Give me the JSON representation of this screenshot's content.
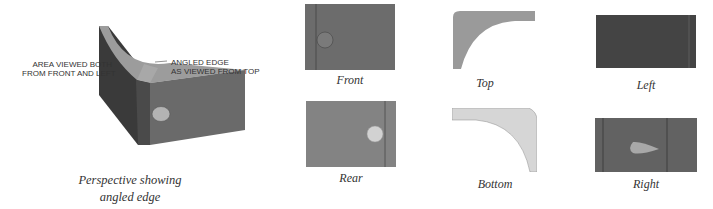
{
  "perspective": {
    "callout_left": [
      "AREA VIEWED BOTH",
      "FROM FRONT AND LEFT"
    ],
    "callout_right": [
      "ANGLED EDGE",
      "AS VIEWED FROM TOP"
    ],
    "caption_line1": "Perspective showing angled edge",
    "caption_line2": "and area"
  },
  "views": [
    {
      "id": "front",
      "label": "Front"
    },
    {
      "id": "top",
      "label": "Top"
    },
    {
      "id": "left",
      "label": "Left"
    },
    {
      "id": "rear",
      "label": "Rear"
    },
    {
      "id": "bottom",
      "label": "Bottom"
    },
    {
      "id": "right",
      "label": "Right"
    }
  ],
  "colors": {
    "dark_face": "#3f3f3f",
    "mid_face": "#6e6e6e",
    "top_face": "#9a9a9a",
    "hole": "#b9b9b9",
    "light_face": "#d8d8d8"
  }
}
